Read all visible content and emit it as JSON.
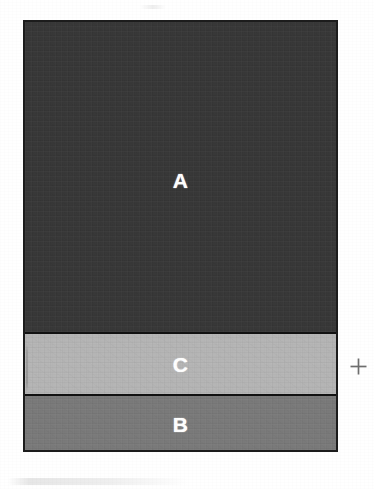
{
  "figure": {
    "background_color": "#ffffff",
    "box": {
      "border_color": "#1c1c1c",
      "x": 23,
      "y": 20,
      "width": 315,
      "height": 432
    },
    "bands": [
      {
        "id": "a",
        "label": "A",
        "fill_color": "#383838",
        "label_color": "#ffffff",
        "height": 312,
        "order": 1
      },
      {
        "id": "c",
        "label": "C",
        "fill_color": "#b5b5b5",
        "label_color": "#ffffff",
        "height": 62,
        "order": 2
      },
      {
        "id": "b",
        "label": "B",
        "fill_color": "#7a7a7a",
        "label_color": "#ffffff",
        "height": 54,
        "order": 3
      }
    ],
    "markers": [
      {
        "id": "registration-cross",
        "glyph": "+",
        "color": "#6e6e6e",
        "x": 358,
        "y": 366
      }
    ],
    "artifacts": [
      {
        "id": "left-edge-streak",
        "kind": "vertical-line"
      },
      {
        "id": "bottom-smudge-band",
        "kind": "horizontal-band"
      },
      {
        "id": "top-right-fleck",
        "kind": "horizontal-band"
      }
    ]
  }
}
